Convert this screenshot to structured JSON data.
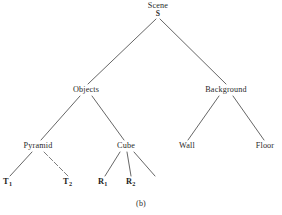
{
  "figure": {
    "caption": "(b)",
    "background_color": "#ffffff",
    "stroke_color": "#4a4a4a"
  },
  "tree": {
    "root": {
      "label": "Scene",
      "sublabel": "S"
    },
    "level2": [
      {
        "label": "Objects"
      },
      {
        "label": "Background"
      }
    ],
    "level3": [
      {
        "label": "Pyramid"
      },
      {
        "label": "Cube"
      },
      {
        "label": "Wall"
      },
      {
        "label": "Floor"
      }
    ],
    "leaves": [
      {
        "symbol": "T",
        "subscript": "1"
      },
      {
        "symbol": "T",
        "subscript": "2"
      },
      {
        "symbol": "R",
        "subscript": "1"
      },
      {
        "symbol": "R",
        "subscript": "2"
      }
    ]
  }
}
